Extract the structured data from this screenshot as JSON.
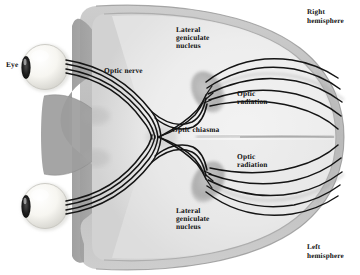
{
  "figure": {
    "background_color": "#ffffff",
    "ink_color": "#111111",
    "brain_fill": "#e9e9e9",
    "skull_fill": "#bdbdbd",
    "face_fill": "#9a9a9a",
    "eye_fill": "#fbfbf7",
    "lgn_fill": "#9c9c9c"
  },
  "labels": {
    "eye": "Eye",
    "optic_nerve": "Optic nerve",
    "optic_chiasma": "Optic chiasma",
    "lgn_top_line1": "Lateral",
    "lgn_top_line2": "geniculate",
    "lgn_top_line3": "nucleus",
    "lgn_bottom_line1": "Lateral",
    "lgn_bottom_line2": "geniculate",
    "lgn_bottom_line3": "nucleus",
    "optic_radiation_top_line1": "Optic",
    "optic_radiation_top_line2": "radiation",
    "optic_radiation_bottom_line1": "Optic",
    "optic_radiation_bottom_line2": "radiation",
    "right_hemisphere_line1": "Right",
    "right_hemisphere_line2": "hemisphere",
    "left_hemisphere_line1": "Left",
    "left_hemisphere_line2": "hemisphere"
  },
  "structures": [
    {
      "name": "eye-right",
      "type": "eyeball"
    },
    {
      "name": "eye-left",
      "type": "eyeball"
    },
    {
      "name": "optic-nerve-right",
      "type": "nerve-bundle"
    },
    {
      "name": "optic-nerve-left",
      "type": "nerve-bundle"
    },
    {
      "name": "optic-chiasma",
      "type": "decussation"
    },
    {
      "name": "lateral-geniculate-nucleus-right",
      "type": "nucleus"
    },
    {
      "name": "lateral-geniculate-nucleus-left",
      "type": "nucleus"
    },
    {
      "name": "optic-radiation-right",
      "type": "fiber-fan"
    },
    {
      "name": "optic-radiation-left",
      "type": "fiber-fan"
    },
    {
      "name": "right-hemisphere",
      "type": "cerebral-hemisphere"
    },
    {
      "name": "left-hemisphere",
      "type": "cerebral-hemisphere"
    }
  ]
}
